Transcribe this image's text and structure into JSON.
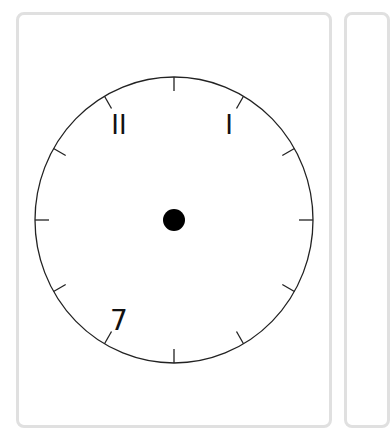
{
  "clock": {
    "labels": [
      {
        "text": "I",
        "position": "1 o'clock"
      },
      {
        "text": "II",
        "position": "11 o'clock"
      },
      {
        "text": "7",
        "position": "7 o'clock"
      }
    ],
    "tick_count": 12,
    "center_dot": true
  }
}
